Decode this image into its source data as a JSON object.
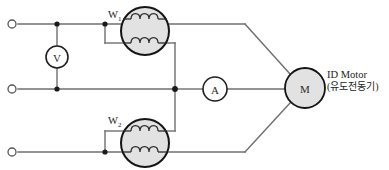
{
  "diagram": {
    "type": "electrical-schematic",
    "background_color": "#ffffff",
    "wire_color": "#6f6f6f",
    "component_fill": "#e2e2e2",
    "component_stroke": "#141414"
  },
  "supply": {
    "terminal_count": 3,
    "terminals": [
      {
        "name": "terminal-line-1",
        "label": "",
        "x": 12,
        "y": 24
      },
      {
        "name": "terminal-line-2",
        "label": "",
        "x": 12,
        "y": 89
      },
      {
        "name": "terminal-line-3",
        "label": "",
        "x": 12,
        "y": 152
      }
    ]
  },
  "meters": {
    "voltmeter": {
      "label": "V",
      "icon": "voltmeter-circle-icon",
      "cx": 57,
      "cy": 57,
      "r": 11
    },
    "ammeter": {
      "label": "A",
      "icon": "ammeter-circle-icon",
      "cx": 215,
      "cy": 89,
      "r": 12
    },
    "wattmeter_1": {
      "label": "W",
      "subscript": "1",
      "icon": "wattmeter-coil-icon",
      "cx": 145,
      "cy": 31,
      "r": 24
    },
    "wattmeter_2": {
      "label": "W",
      "subscript": "2",
      "icon": "wattmeter-coil-icon",
      "cx": 145,
      "cy": 143,
      "r": 24
    }
  },
  "load": {
    "motor": {
      "label": "M",
      "icon": "motor-circle-icon",
      "cx": 305,
      "cy": 88,
      "r": 20,
      "annotation_line_1": "ID Motor",
      "annotation_line_2": "(유도전동기)"
    }
  }
}
